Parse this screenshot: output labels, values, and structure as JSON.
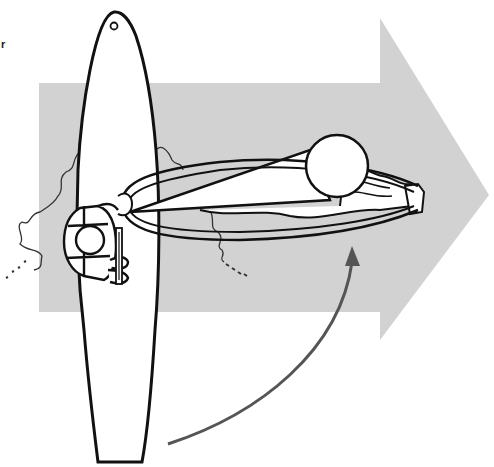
{
  "figure": {
    "corner_mark": "r",
    "colors": {
      "background": "#ffffff",
      "wind_arrow": "#d2d2d2",
      "outline": "#111111",
      "rotation_arrow": "#555555",
      "wake": "#333333"
    }
  }
}
